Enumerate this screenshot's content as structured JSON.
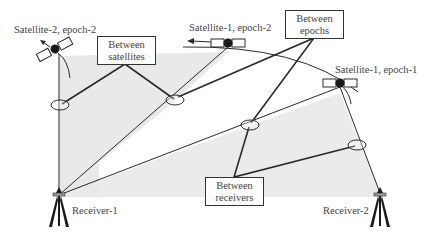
{
  "diagram": {
    "satellites": [
      {
        "id": "sat2-ep2",
        "label": "Satellite-2, epoch-2"
      },
      {
        "id": "sat1-ep2",
        "label": "Satellite-1, epoch-2"
      },
      {
        "id": "sat1-ep1",
        "label": "Satellite-1, epoch-1"
      }
    ],
    "receivers": [
      {
        "id": "rx1",
        "label": "Receiver-1"
      },
      {
        "id": "rx2",
        "label": "Receiver-2"
      }
    ],
    "boxes": {
      "between_satellites": {
        "line1": "Between",
        "line2": "satellites"
      },
      "between_epochs": {
        "line1": "Between",
        "line2": "epochs"
      },
      "between_receivers": {
        "line1": "Between",
        "line2": "receivers"
      }
    },
    "colors": {
      "shade": "#e9e9e9",
      "line": "#2a2a2a",
      "text": "#444444"
    }
  }
}
